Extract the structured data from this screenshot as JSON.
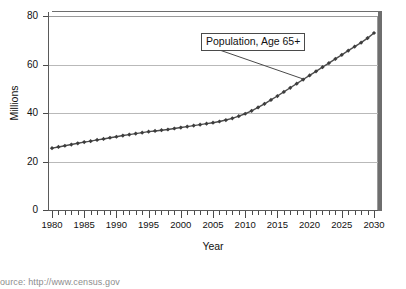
{
  "chart_data": {
    "type": "line",
    "title": "",
    "xlabel": "Year",
    "ylabel": "Millions",
    "xlim": [
      1980,
      2030
    ],
    "ylim": [
      0,
      80
    ],
    "yticks": [
      0,
      20,
      40,
      60,
      80
    ],
    "xticks": [
      1980,
      1985,
      1990,
      1995,
      2000,
      2005,
      2010,
      2015,
      2020,
      2025,
      2030
    ],
    "x_tick_step_minor": 1,
    "grid": "horizontal",
    "legend": "none",
    "marker": "diamond",
    "line_color": "#4d4d4d",
    "marker_color": "#3d3d3d",
    "grid_color": "#b9b9b9",
    "annotations": [
      {
        "text": "Population, Age 65+",
        "points_to_year": 2019,
        "points_to_value": 54
      }
    ],
    "series": [
      {
        "name": "Population, Age 65+",
        "x": [
          1980,
          1981,
          1982,
          1983,
          1984,
          1985,
          1986,
          1987,
          1988,
          1989,
          1990,
          1991,
          1992,
          1993,
          1994,
          1995,
          1996,
          1997,
          1998,
          1999,
          2000,
          2001,
          2002,
          2003,
          2004,
          2005,
          2006,
          2007,
          2008,
          2009,
          2010,
          2011,
          2012,
          2013,
          2014,
          2015,
          2016,
          2017,
          2018,
          2019,
          2020,
          2021,
          2022,
          2023,
          2024,
          2025,
          2026,
          2027,
          2028,
          2029,
          2030
        ],
        "values": [
          25.5,
          26.0,
          26.5,
          27.0,
          27.5,
          28.0,
          28.4,
          28.9,
          29.3,
          29.8,
          30.2,
          30.7,
          31.1,
          31.5,
          31.9,
          32.3,
          32.6,
          32.9,
          33.2,
          33.6,
          34.0,
          34.4,
          34.8,
          35.2,
          35.6,
          36.0,
          36.5,
          37.1,
          37.8,
          38.7,
          39.7,
          40.9,
          42.3,
          43.8,
          45.4,
          47.0,
          48.7,
          50.4,
          52.1,
          53.8,
          55.5,
          57.2,
          58.9,
          60.6,
          62.3,
          64.0,
          65.7,
          67.4,
          69.0,
          70.9,
          73.0
        ]
      }
    ]
  },
  "axes": {
    "y_title": "Millions",
    "x_title": "Year",
    "y_tick_labels": [
      "0",
      "20",
      "40",
      "60",
      "80"
    ],
    "x_tick_labels": [
      "1980",
      "1985",
      "1990",
      "1995",
      "2000",
      "2005",
      "2010",
      "2015",
      "2020",
      "2025",
      "2030"
    ]
  },
  "annotation": {
    "label": "Population, Age 65+"
  },
  "footer": {
    "source": "ource: http://www.census.gov"
  }
}
